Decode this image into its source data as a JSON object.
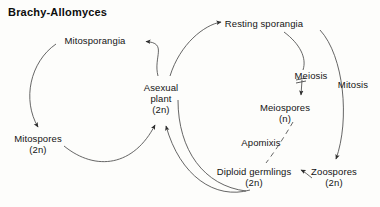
{
  "figure": {
    "title": "Brachy-Allomyces",
    "type": "life-cycle-diagram",
    "background_color": "#fdfdfb",
    "line_color": "#3a3a3a",
    "text_color": "#141414"
  },
  "nodes": [
    {
      "id": "mitosporangia",
      "label": "Mitosporangia",
      "ploidy": "",
      "x": 95,
      "y": 41
    },
    {
      "id": "mitospores",
      "label": "Mitospores",
      "ploidy": "(2n)",
      "x": 38,
      "y": 139
    },
    {
      "id": "asexual-plant",
      "label": "Asexual",
      "label2": "plant",
      "ploidy": "(2n)",
      "x": 161,
      "y": 88
    },
    {
      "id": "resting-sporangia",
      "label": "Resting sporangia",
      "ploidy": "",
      "x": 264,
      "y": 24
    },
    {
      "id": "meiospores",
      "label": "Meiospores",
      "ploidy": "(n)",
      "x": 285,
      "y": 108
    },
    {
      "id": "zoospores",
      "label": "Zoospores",
      "ploidy": "(2n)",
      "x": 334,
      "y": 172
    },
    {
      "id": "diploid-germlings",
      "label": "Diploid germlings",
      "ploidy": "(2n)",
      "x": 254,
      "y": 172
    }
  ],
  "processes": [
    {
      "id": "meiosis",
      "label": "Meiosis",
      "x": 296,
      "y": 76,
      "marker": "R-bar"
    },
    {
      "id": "mitosis",
      "label": "Mitosis",
      "x": 340,
      "y": 84
    },
    {
      "id": "apomixis",
      "label": "Apomixis",
      "x": 259,
      "y": 143,
      "style": "dashed"
    }
  ],
  "icons": {
    "arrowhead": "arrowhead-icon",
    "meiosis_bar": "meiosis-crossbar-icon"
  }
}
